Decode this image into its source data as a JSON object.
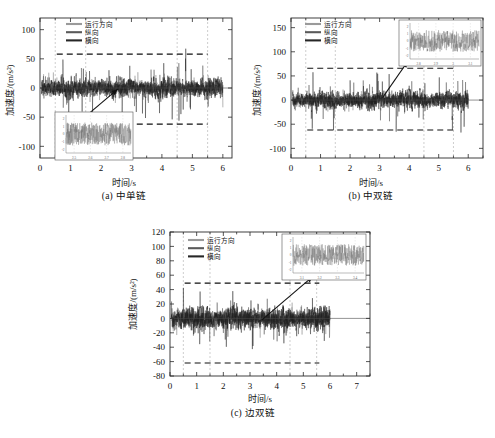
{
  "figure": {
    "panels": [
      {
        "id": "a",
        "caption": "(a) 中单链",
        "xlabel": "时间/s",
        "ylabel": "加速度/(m/s²)",
        "legend": [
          "运行方向",
          "纵向",
          "横向"
        ],
        "xticks": [
          "0",
          "1",
          "2",
          "3",
          "4",
          "5",
          "6"
        ],
        "yticks": [
          "100",
          "50",
          "0",
          "-50",
          "-100"
        ],
        "inset_xticks": [
          "2.5",
          "2.6",
          "2.7",
          "2.8"
        ],
        "inset_yticks": [
          "2",
          "1",
          "0",
          "-1",
          "-2"
        ]
      },
      {
        "id": "b",
        "caption": "(b) 中双链",
        "xlabel": "时间/s",
        "ylabel": "加速度/(m/s²)",
        "legend": [
          "运行方向",
          "纵向",
          "横向"
        ],
        "xticks": [
          "0",
          "1",
          "2",
          "3",
          "4",
          "5",
          "6"
        ],
        "yticks": [
          "150",
          "100",
          "50",
          "0",
          "-50",
          "-100"
        ],
        "inset_xticks": [
          "2.8",
          "2.9",
          "3.0",
          "3.1"
        ],
        "inset_yticks": [
          "2",
          "1",
          "0",
          "-1",
          "-2"
        ]
      },
      {
        "id": "c",
        "caption": "(c) 边双链",
        "xlabel": "时间/s",
        "ylabel": "加速度/(m/s²)",
        "legend": [
          "运行方向",
          "纵向",
          "横向"
        ],
        "xticks": [
          "0",
          "1",
          "2",
          "3",
          "4",
          "5",
          "6",
          "7"
        ],
        "yticks": [
          "120",
          "100",
          "80",
          "60",
          "40",
          "20",
          "0",
          "-20",
          "-40",
          "-60",
          "-80"
        ],
        "inset_xticks": [
          "3.1",
          "3.2",
          "3.3",
          "3.4"
        ],
        "inset_yticks": [
          "2",
          "1",
          "0",
          "-1",
          "-2"
        ]
      }
    ]
  },
  "chart_data": [
    {
      "type": "line",
      "panel": "a",
      "title": "(a) 中单链",
      "xlabel": "时间/s",
      "ylabel": "加速度/(m/s²)",
      "xlim": [
        0,
        6.3
      ],
      "ylim": [
        -120,
        120
      ],
      "xticks": [
        0,
        1,
        2,
        3,
        4,
        5,
        6
      ],
      "yticks": [
        100,
        50,
        0,
        -50,
        -100
      ],
      "grid": "vertical-dotted",
      "gridlines_x": [
        0.5,
        1.5,
        4.5,
        5.5
      ],
      "legend": [
        "运行方向",
        "纵向",
        "横向"
      ],
      "legend_position": "top-left",
      "series": [
        {
          "name": "运行方向",
          "color": "#8f8f8f",
          "description": "broadband vibration noise",
          "data_span_x": [
            0.05,
            6.0
          ],
          "amplitude_rms": 9,
          "amplitude_peak": 45
        },
        {
          "name": "纵向",
          "color": "#4d4d4d",
          "description": "broadband vibration noise",
          "data_span_x": [
            0.05,
            6.0
          ],
          "amplitude_rms": 14,
          "amplitude_peak": 72
        },
        {
          "name": "横向",
          "color": "#1f1f1f",
          "description": "broadband vibration noise",
          "data_span_x": [
            0.05,
            6.0
          ],
          "amplitude_rms": 18,
          "amplitude_peak": 105
        }
      ],
      "annotations": [
        {
          "type": "threshold-line",
          "style": "dashed",
          "y": 58,
          "x_from": 0.55,
          "x_to": 5.5
        },
        {
          "type": "threshold-line",
          "style": "dashed",
          "y": -62,
          "x_from": 0.55,
          "x_to": 5.5
        },
        {
          "type": "arrow",
          "from_x": 1.35,
          "from_y": -55,
          "to_x": 2.55,
          "to_y": -2
        }
      ],
      "inset": {
        "position": "bottom-left",
        "xlim": [
          2.45,
          2.85
        ],
        "ylim": [
          -2.5,
          2.5
        ],
        "xticks": [
          2.5,
          2.6,
          2.7,
          2.8
        ],
        "yticks": [
          2,
          1,
          0,
          -1,
          -2
        ]
      }
    },
    {
      "type": "line",
      "panel": "b",
      "title": "(b) 中双链",
      "xlabel": "时间/s",
      "ylabel": "加速度/(m/s²)",
      "xlim": [
        0,
        6.5
      ],
      "ylim": [
        -120,
        170
      ],
      "xticks": [
        0,
        1,
        2,
        3,
        4,
        5,
        6
      ],
      "yticks": [
        150,
        100,
        50,
        0,
        -50,
        -100
      ],
      "grid": "vertical-dotted",
      "gridlines_x": [
        0.5,
        1.5,
        4.5,
        5.5
      ],
      "legend": [
        "运行方向",
        "纵向",
        "横向"
      ],
      "legend_position": "top-left",
      "series": [
        {
          "name": "运行方向",
          "color": "#8f8f8f",
          "description": "broadband vibration noise",
          "data_span_x": [
            0.05,
            6.0
          ],
          "amplitude_rms": 10,
          "amplitude_peak": 50
        },
        {
          "name": "纵向",
          "color": "#4d4d4d",
          "description": "broadband vibration noise",
          "data_span_x": [
            0.05,
            6.0
          ],
          "amplitude_rms": 16,
          "amplitude_peak": 80
        },
        {
          "name": "横向",
          "color": "#1f1f1f",
          "description": "broadband vibration noise",
          "data_span_x": [
            0.05,
            6.0
          ],
          "amplitude_rms": 20,
          "amplitude_peak": 115
        }
      ],
      "annotations": [
        {
          "type": "threshold-line",
          "style": "dashed",
          "y": 66,
          "x_from": 0.55,
          "x_to": 5.6
        },
        {
          "type": "threshold-line",
          "style": "dashed",
          "y": -62,
          "x_from": 0.55,
          "x_to": 5.6
        },
        {
          "type": "arrow",
          "from_x": 3.1,
          "from_y": 5,
          "to_x": 3.95,
          "to_y": 80
        }
      ],
      "inset": {
        "position": "top-right",
        "xlim": [
          2.75,
          3.15
        ],
        "ylim": [
          -2.5,
          2.5
        ],
        "xticks": [
          2.8,
          2.9,
          3.0,
          3.1
        ],
        "yticks": [
          2,
          1,
          0,
          -1,
          -2
        ]
      }
    },
    {
      "type": "line",
      "panel": "c",
      "title": "(c) 边双链",
      "xlabel": "时间/s",
      "ylabel": "加速度/(m/s²)",
      "xlim": [
        0,
        7.5
      ],
      "ylim": [
        -80,
        120
      ],
      "xticks": [
        0,
        1,
        2,
        3,
        4,
        5,
        6,
        7
      ],
      "yticks": [
        120,
        100,
        80,
        60,
        40,
        20,
        0,
        -20,
        -40,
        -60,
        -80
      ],
      "grid": "vertical-dotted",
      "gridlines_x": [
        0.5,
        1.5,
        4.5,
        5.5
      ],
      "legend": [
        "运行方向",
        "纵向",
        "横向"
      ],
      "legend_position": "top-left",
      "series": [
        {
          "name": "运行方向",
          "color": "#8f8f8f",
          "description": "broadband vibration noise",
          "data_span_x": [
            0.05,
            6.0
          ],
          "amplitude_rms": 8,
          "amplitude_peak": 38
        },
        {
          "name": "纵向",
          "color": "#4d4d4d",
          "description": "broadband vibration noise",
          "data_span_x": [
            0.05,
            6.0
          ],
          "amplitude_rms": 13,
          "amplitude_peak": 58
        },
        {
          "name": "横向",
          "color": "#1f1f1f",
          "description": "broadband vibration noise",
          "data_span_x": [
            0.05,
            6.0
          ],
          "amplitude_rms": 17,
          "amplitude_peak": 80
        }
      ],
      "annotations": [
        {
          "type": "threshold-line",
          "style": "dashed",
          "y": 49,
          "x_from": 0.55,
          "x_to": 5.6
        },
        {
          "type": "threshold-line",
          "style": "dashed",
          "y": -62,
          "x_from": 0.55,
          "x_to": 5.6
        },
        {
          "type": "arrow",
          "from_x": 3.45,
          "from_y": -2,
          "to_x": 5.35,
          "to_y": 58
        }
      ],
      "inset": {
        "position": "top-right",
        "xlim": [
          3.05,
          3.45
        ],
        "ylim": [
          -2.5,
          2.5
        ],
        "xticks": [
          3.1,
          3.2,
          3.3,
          3.4
        ],
        "yticks": [
          2,
          1,
          0,
          -1,
          -2
        ]
      }
    }
  ]
}
